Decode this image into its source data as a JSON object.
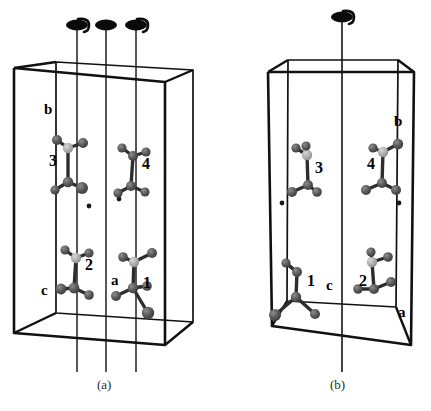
{
  "figure": {
    "type": "crystal-packing-diagram",
    "panel_count": 2,
    "captions": [
      {
        "id": "panel-a-caption",
        "text": "(a)",
        "x": 105,
        "y": 384
      },
      {
        "id": "panel-b-caption",
        "text": "(b)",
        "x": 338,
        "y": 384
      }
    ]
  },
  "panels": [
    {
      "id": "a",
      "caption": "(a)",
      "cell_outline": {
        "front_bottom_left": [
          14,
          333
        ],
        "front_bottom_right": [
          165,
          345
        ],
        "front_top_left": [
          14,
          68
        ],
        "front_top_right": [
          165,
          82
        ],
        "back_bottom_left": [
          56,
          313
        ],
        "back_bottom_right": [
          193,
          322
        ],
        "back_top_left": [
          56,
          62
        ],
        "back_top_right": [
          193,
          70
        ]
      },
      "axis_labels": [
        {
          "name": "b-axis-label",
          "text": "b",
          "x": 48,
          "y": 110
        },
        {
          "name": "c-axis-label",
          "text": "c",
          "x": 45,
          "y": 291
        },
        {
          "name": "a-axis-label",
          "text": "a",
          "x": 115,
          "y": 281
        }
      ],
      "symmetry_elements": [
        {
          "name": "screw-axis-2-1-left",
          "symbol": "2_1",
          "type": "two-fold-screw",
          "x": 77,
          "y_top": 20,
          "y_bottom": 372
        },
        {
          "name": "rotation-axis-2-middle",
          "symbol": "2",
          "type": "two-fold-rotation",
          "x": 106,
          "y_top": 20,
          "y_bottom": 372
        },
        {
          "name": "screw-axis-2-1-right",
          "symbol": "2_1",
          "type": "two-fold-screw",
          "x": 136,
          "y_top": 20,
          "y_bottom": 372
        }
      ],
      "inversion_centers": [
        {
          "name": "inversion-center-dot",
          "x": 89,
          "y": 206
        },
        {
          "name": "inversion-center-dot",
          "x": 119,
          "y": 199
        }
      ],
      "molecules": [
        {
          "label": "3",
          "label_x": 54,
          "label_y": 161,
          "center_x": 68,
          "center_y": 168
        },
        {
          "label": "4",
          "label_x": 146,
          "label_y": 164,
          "center_x": 133,
          "center_y": 172
        },
        {
          "label": "2",
          "label_x": 89,
          "label_y": 265,
          "center_x": 76,
          "center_y": 272
        },
        {
          "label": "1",
          "label_x": 147,
          "label_y": 283,
          "center_x": 134,
          "center_y": 276
        }
      ]
    },
    {
      "id": "b",
      "caption": "(b)",
      "cell_outline": {
        "front_bottom_left": [
          272,
          326
        ],
        "front_bottom_right": [
          411,
          345
        ],
        "front_top_left": [
          268,
          72
        ],
        "front_top_right": [
          414,
          72
        ],
        "back_bottom_left": [
          287,
          301
        ],
        "back_bottom_right": [
          396,
          307
        ],
        "back_top_left": [
          288,
          60
        ],
        "back_top_right": [
          398,
          60
        ]
      },
      "axis_labels": [
        {
          "name": "b-axis-label",
          "text": "b",
          "x": 398,
          "y": 122
        },
        {
          "name": "c-axis-label",
          "text": "c",
          "x": 330,
          "y": 286
        },
        {
          "name": "a-axis-label",
          "text": "a",
          "x": 402,
          "y": 313
        }
      ],
      "symmetry_elements": [
        {
          "name": "screw-axis-2-1-center",
          "symbol": "2_1",
          "type": "two-fold-screw",
          "x": 342,
          "y_top": 12,
          "y_bottom": 372
        }
      ],
      "inversion_centers": [
        {
          "name": "inversion-center-dot",
          "x": 282,
          "y": 203
        },
        {
          "name": "inversion-center-dot",
          "x": 399,
          "y": 203
        }
      ],
      "molecules": [
        {
          "label": "3",
          "label_x": 319,
          "label_y": 168,
          "center_x": 306,
          "center_y": 172
        },
        {
          "label": "4",
          "label_x": 371,
          "label_y": 164,
          "center_x": 384,
          "center_y": 172
        },
        {
          "label": "1",
          "label_x": 311,
          "label_y": 281,
          "center_x": 299,
          "center_y": 276
        },
        {
          "label": "2",
          "label_x": 363,
          "label_y": 281,
          "center_x": 376,
          "center_y": 266
        }
      ]
    }
  ],
  "style": {
    "cell_edge_color": "#111111",
    "axis_line_color": "#3a3a3a",
    "atom_dark_color": "#555555",
    "atom_light_color": "#aaaaaa",
    "bond_color": "#2d2d2d",
    "background_color": "#ffffff"
  }
}
